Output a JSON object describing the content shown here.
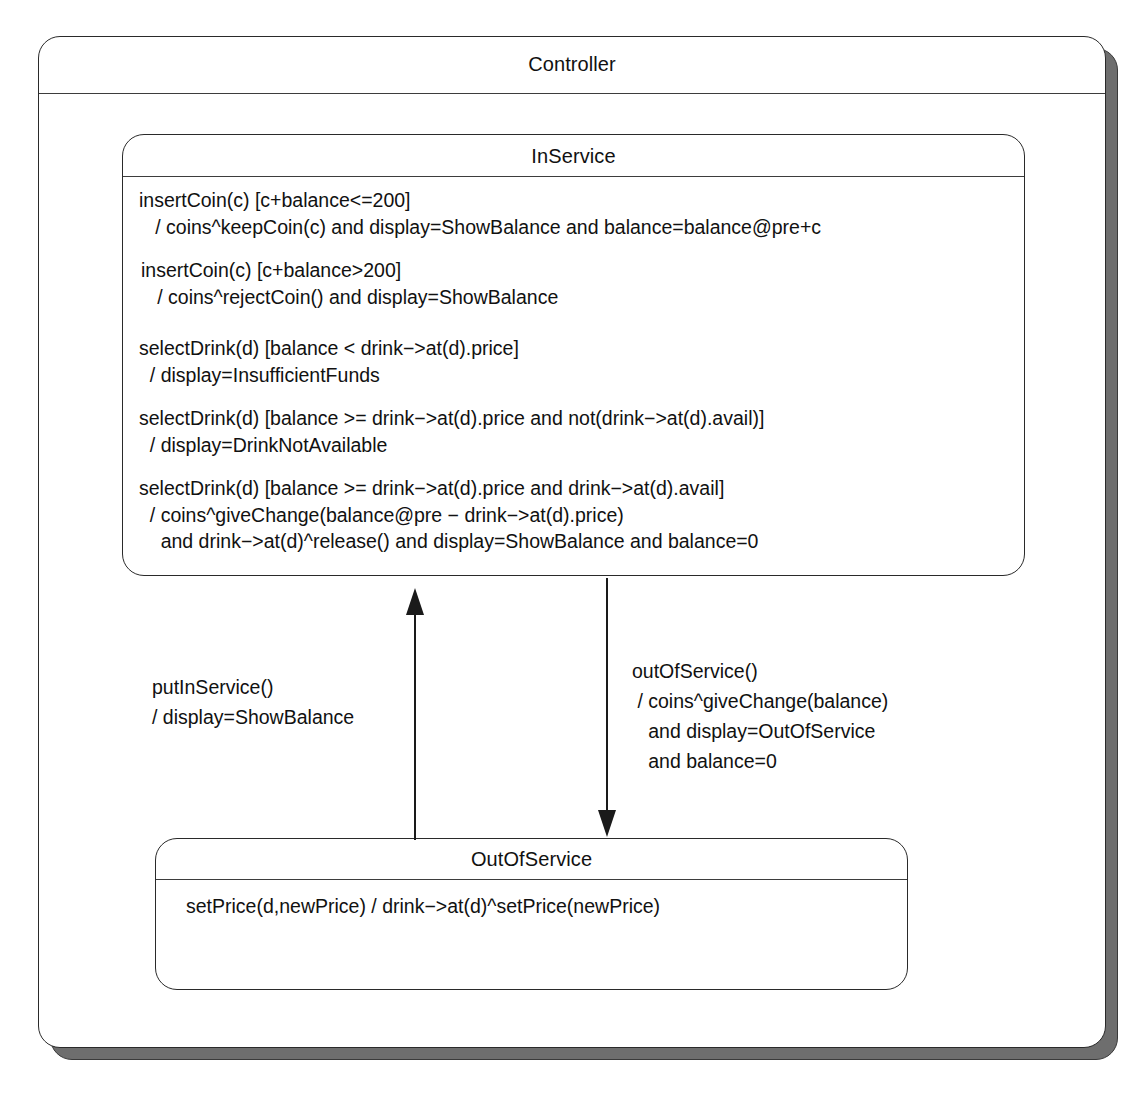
{
  "diagram": {
    "kind": "uml-state-machine",
    "title": "Controller"
  },
  "controller": {
    "name": "Controller"
  },
  "states": {
    "in_service": {
      "name": "InService",
      "transitions": [
        {
          "id": "insert-coin-accept",
          "text": "insertCoin(c) [c+balance<=200]\n   / coins^keepCoin(c) and display=ShowBalance and balance=balance@pre+c"
        },
        {
          "id": "insert-coin-reject",
          "text": "insertCoin(c) [c+balance>200]\n   / coins^rejectCoin() and display=ShowBalance"
        },
        {
          "id": "select-drink-insufficient",
          "text": "selectDrink(d) [balance < drink−>at(d).price]\n  / display=InsufficientFunds"
        },
        {
          "id": "select-drink-unavailable",
          "text": "selectDrink(d) [balance >= drink−>at(d).price and not(drink−>at(d).avail)]\n  / display=DrinkNotAvailable"
        },
        {
          "id": "select-drink-dispense",
          "text": "selectDrink(d) [balance >= drink−>at(d).price and drink−>at(d).avail]\n  / coins^giveChange(balance@pre − drink−>at(d).price)\n    and drink−>at(d)^release() and display=ShowBalance and balance=0"
        }
      ]
    },
    "out_of_service": {
      "name": "OutOfService",
      "transitions": [
        {
          "id": "set-price",
          "text": "setPrice(d,newPrice) / drink−>at(d)^setPrice(newPrice)"
        }
      ]
    }
  },
  "edges": {
    "put_in_service": {
      "id": "put-in-service",
      "from": "OutOfService",
      "to": "InService",
      "direction": "up",
      "label": "putInService()\n/ display=ShowBalance"
    },
    "out_of_service": {
      "id": "out-of-service",
      "from": "InService",
      "to": "OutOfService",
      "direction": "down",
      "label": "outOfService()\n / coins^giveChange(balance)\n   and display=OutOfService\n   and balance=0"
    }
  },
  "colors": {
    "line": "#2a2a2a",
    "shadow": "#6e6e6e",
    "background": "#ffffff",
    "text": "#111111"
  }
}
